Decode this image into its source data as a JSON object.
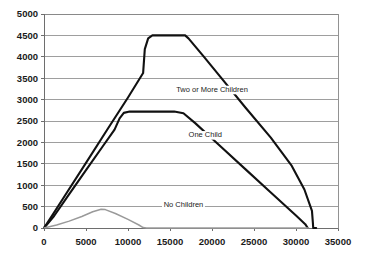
{
  "chart_data": {
    "type": "line",
    "title": "",
    "subtitle": "",
    "xlabel": "",
    "ylabel": "",
    "xlim": [
      0,
      35000
    ],
    "ylim": [
      0,
      5000
    ],
    "grid": true,
    "legend_position": "inline-annotations",
    "xticks": [
      "0",
      "5000",
      "10000",
      "15000",
      "20000",
      "25000",
      "30000",
      "35000"
    ],
    "xtick_values": [
      0,
      5000,
      10000,
      15000,
      20000,
      25000,
      30000,
      35000
    ],
    "yticks": [
      "0",
      "500",
      "1000",
      "1500",
      "2000",
      "2500",
      "3000",
      "3500",
      "4000",
      "4500",
      "5000"
    ],
    "ytick_values": [
      0,
      500,
      1000,
      1500,
      2000,
      2500,
      3000,
      3500,
      4000,
      4500,
      5000
    ],
    "series": [
      {
        "name": "Two or More Children",
        "color": "#111111",
        "label_x": 20000,
        "label_y": 3180,
        "points": [
          [
            0,
            0
          ],
          [
            1100,
            330
          ],
          [
            2500,
            760
          ],
          [
            5000,
            1520
          ],
          [
            7500,
            2290
          ],
          [
            10000,
            3050
          ],
          [
            11800,
            3620
          ],
          [
            12000,
            4180
          ],
          [
            12400,
            4430
          ],
          [
            12900,
            4500
          ],
          [
            14000,
            4500
          ],
          [
            15500,
            4500
          ],
          [
            16800,
            4500
          ],
          [
            17200,
            4430
          ],
          [
            19000,
            4010
          ],
          [
            21000,
            3530
          ],
          [
            24000,
            2810
          ],
          [
            27000,
            2110
          ],
          [
            29500,
            1450
          ],
          [
            31000,
            900
          ],
          [
            31900,
            400
          ],
          [
            32000,
            150
          ],
          [
            32050,
            0
          ],
          [
            32400,
            0
          ]
        ]
      },
      {
        "name": "One Child",
        "color": "#111111",
        "label_x": 19200,
        "label_y": 2120,
        "points": [
          [
            0,
            0
          ],
          [
            1200,
            280
          ],
          [
            3000,
            790
          ],
          [
            5000,
            1350
          ],
          [
            7000,
            1910
          ],
          [
            8400,
            2300
          ],
          [
            9000,
            2560
          ],
          [
            9500,
            2690
          ],
          [
            10200,
            2720
          ],
          [
            12000,
            2720
          ],
          [
            14000,
            2720
          ],
          [
            15500,
            2720
          ],
          [
            16600,
            2680
          ],
          [
            18000,
            2450
          ],
          [
            21000,
            1910
          ],
          [
            24000,
            1370
          ],
          [
            27000,
            830
          ],
          [
            30000,
            290
          ],
          [
            31100,
            90
          ],
          [
            31400,
            0
          ]
        ]
      },
      {
        "name": "No Children",
        "color": "#9a9a9a",
        "label_x": 16600,
        "label_y": 480,
        "points": [
          [
            0,
            0
          ],
          [
            1500,
            70
          ],
          [
            3000,
            160
          ],
          [
            4500,
            270
          ],
          [
            5800,
            380
          ],
          [
            6800,
            440
          ],
          [
            7300,
            430
          ],
          [
            8500,
            340
          ],
          [
            10000,
            200
          ],
          [
            11300,
            70
          ],
          [
            11800,
            10
          ],
          [
            12200,
            0
          ],
          [
            31500,
            0
          ]
        ]
      }
    ]
  },
  "annotations": {
    "two_or_more": "Two or More Children",
    "one_child": "One Child",
    "no_children": "No Children"
  }
}
